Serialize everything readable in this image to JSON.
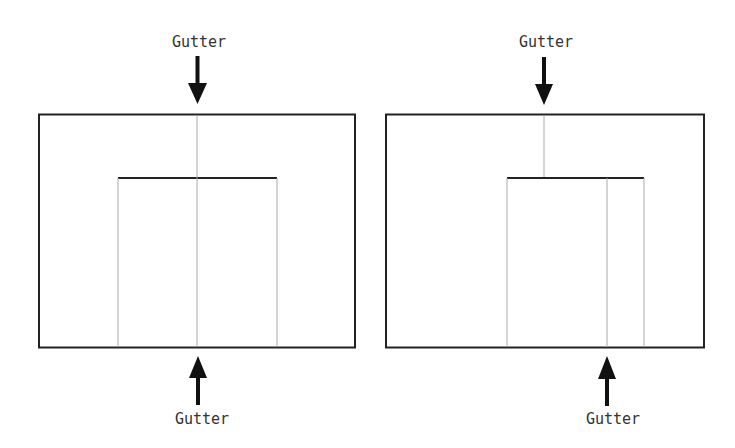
{
  "diagrams": [
    {
      "name": "centered-gutter",
      "top_label": "Gutter",
      "bottom_label": "Gutter"
    },
    {
      "name": "offset-gutter",
      "top_label": "Gutter",
      "bottom_label": "Gutter"
    }
  ],
  "colors": {
    "frame": "#222222",
    "guide": "#aaaaaa",
    "arrow": "#111111"
  }
}
